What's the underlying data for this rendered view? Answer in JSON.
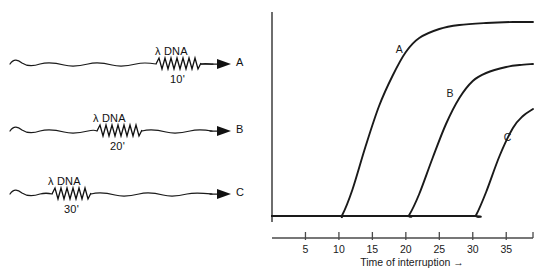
{
  "diagram": {
    "rows": [
      {
        "lambda_label": "λ DNA",
        "time_label": "10'",
        "endpoint_label": "A",
        "lambda_center_x": 178,
        "row_top": 38
      },
      {
        "lambda_label": "λ DNA",
        "time_label": "20'",
        "endpoint_label": "B",
        "lambda_center_x": 113,
        "row_top": 105
      },
      {
        "lambda_label": "λ DNA",
        "time_label": "30'",
        "endpoint_label": "C",
        "lambda_center_x": 68,
        "row_top": 168
      }
    ]
  },
  "chart_data": {
    "type": "line",
    "title": "",
    "xlabel": "Time of interruption →",
    "ylabel": "Infectious centers →",
    "xlim": [
      0,
      39
    ],
    "ylim": [
      0,
      1.05
    ],
    "xticks": [
      5,
      10,
      15,
      20,
      25,
      30,
      35
    ],
    "xtick_labels": [
      "5",
      "10",
      "15",
      "20",
      "25",
      "30",
      "35"
    ],
    "yticks": [],
    "ytick_labels": [],
    "grid": false,
    "legend": "inline-curve-labels",
    "series": [
      {
        "name": "A",
        "label": "A",
        "onset": 10.5,
        "plateau": 1.0,
        "x": [
          0,
          5,
          10,
          10.5,
          12,
          14,
          16,
          18,
          20,
          22,
          25,
          28,
          32,
          36,
          39
        ],
        "y": [
          0.03,
          0.03,
          0.03,
          0.035,
          0.16,
          0.38,
          0.58,
          0.73,
          0.85,
          0.92,
          0.965,
          0.985,
          0.995,
          1.0,
          1.0
        ]
      },
      {
        "name": "B",
        "label": "B",
        "onset": 20.5,
        "plateau": 0.79,
        "x": [
          0,
          10,
          20,
          20.5,
          22,
          24,
          26,
          28,
          30,
          32,
          35,
          37,
          39
        ],
        "y": [
          0.03,
          0.03,
          0.03,
          0.035,
          0.14,
          0.32,
          0.49,
          0.62,
          0.705,
          0.745,
          0.775,
          0.785,
          0.79
        ]
      },
      {
        "name": "C",
        "label": "C",
        "onset": 30.5,
        "plateau": 0.565,
        "x": [
          0,
          15,
          30,
          30.5,
          32,
          34,
          36,
          37.5,
          39
        ],
        "y": [
          0.03,
          0.03,
          0.03,
          0.035,
          0.15,
          0.33,
          0.47,
          0.53,
          0.565
        ]
      }
    ],
    "curve_labels": [
      {
        "text": "A",
        "x": 19.0,
        "y": 0.845
      },
      {
        "text": "B",
        "x": 26.6,
        "y": 0.625
      },
      {
        "text": "C",
        "x": 35.2,
        "y": 0.405
      }
    ]
  }
}
